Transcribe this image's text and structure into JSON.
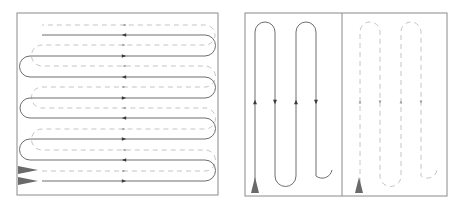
{
  "diagram": {
    "type": "coverage-path-comparison",
    "colors": {
      "frame": "#8a8a8a",
      "solid_path": "#6e6e6e",
      "dashed_path": "#c4c4c4",
      "arrow_solid": "#3a3a3a",
      "arrow_dashed": "#9a9a9a",
      "start_marker": "#6a6a6a",
      "background": "#ffffff"
    },
    "left_panel": {
      "frame": {
        "x": 17,
        "y": 13,
        "w": 201,
        "h": 182
      },
      "orientation": "horizontal-sweeps",
      "solid_rows_y": [
        35,
        56,
        77,
        98,
        118,
        139,
        160,
        181
      ],
      "dashed_rows_y": [
        25,
        45,
        66,
        87,
        108,
        129,
        150,
        171
      ],
      "sweep_x_range": [
        42,
        205
      ],
      "arrow_column_x": 124,
      "start_markers": [
        {
          "y": 170,
          "label": "start-dashed"
        },
        {
          "y": 181,
          "label": "start-solid"
        }
      ]
    },
    "right_panel": {
      "frame": {
        "x": 245,
        "y": 13,
        "w": 202,
        "h": 183
      },
      "divider_x": 342,
      "left_half": {
        "style": "solid",
        "columns_x": [
          255,
          275,
          296,
          316
        ],
        "top_y": 32,
        "bottom_y": 176,
        "arrow_row_y": 102,
        "start_marker": {
          "x": 255,
          "y": 193
        }
      },
      "right_half": {
        "style": "dashed",
        "columns_x": [
          360,
          380,
          401,
          421
        ],
        "top_y": 32,
        "bottom_y": 176,
        "arrow_row_y": 102,
        "start_marker": {
          "x": 359,
          "y": 193
        }
      }
    }
  }
}
